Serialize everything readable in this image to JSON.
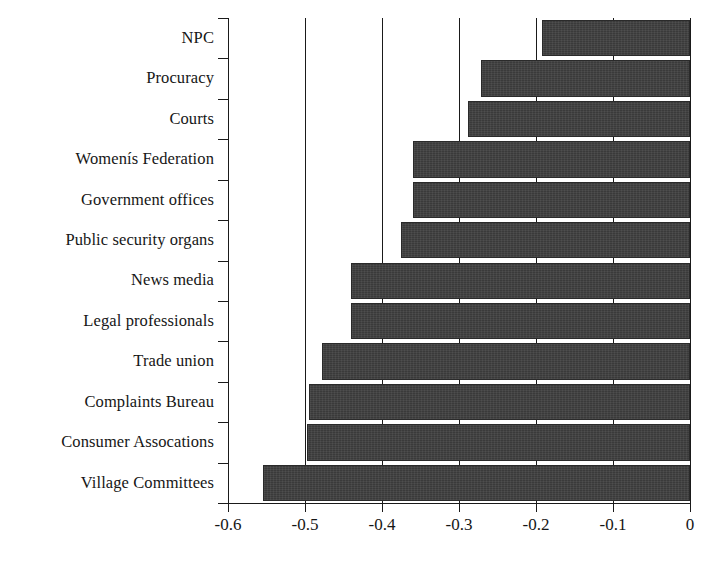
{
  "chart_data": {
    "type": "bar",
    "orientation": "horizontal",
    "title": "",
    "subtitle": "",
    "xlabel": "",
    "ylabel": "",
    "xlim": [
      -0.6,
      0
    ],
    "xticks": [
      -0.6,
      -0.5,
      -0.4,
      -0.3,
      -0.2,
      -0.1,
      0
    ],
    "xtick_labels": [
      "-0.6",
      "-0.5",
      "-0.4",
      "-0.3",
      "-0.2",
      "-0.1",
      "0"
    ],
    "grid": true,
    "grid_axis": "x",
    "legend": false,
    "legend_position": "none",
    "bar_color": "#3a3a3a",
    "axis_color": "#1a1a1a",
    "background_color": "#ffffff",
    "categories": [
      "NPC",
      "Procuracy",
      "Courts",
      "Womenís Federation",
      "Government offices",
      "Public security organs",
      "News media",
      "Legal professionals",
      "Trade union",
      "Complaints Bureau",
      "Consumer Assocations",
      "Village Committees"
    ],
    "values": [
      -0.192,
      -0.272,
      -0.288,
      -0.36,
      -0.36,
      -0.375,
      -0.44,
      -0.44,
      -0.478,
      -0.495,
      -0.497,
      -0.555
    ],
    "bars": [
      {
        "category": "NPC",
        "value": -0.192
      },
      {
        "category": "Procuracy",
        "value": -0.272
      },
      {
        "category": "Courts",
        "value": -0.288
      },
      {
        "category": "Womenís Federation",
        "value": -0.36
      },
      {
        "category": "Government offices",
        "value": -0.36
      },
      {
        "category": "Public security organs",
        "value": -0.375
      },
      {
        "category": "News media",
        "value": -0.44
      },
      {
        "category": "Legal professionals",
        "value": -0.44
      },
      {
        "category": "Trade union",
        "value": -0.478
      },
      {
        "category": "Complaints Bureau",
        "value": -0.495
      },
      {
        "category": "Consumer Assocations",
        "value": -0.497
      },
      {
        "category": "Village Committees",
        "value": -0.555
      }
    ]
  }
}
